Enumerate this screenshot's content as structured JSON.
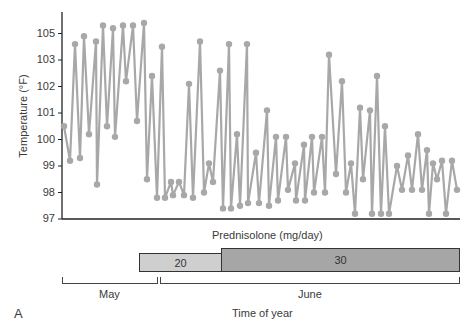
{
  "panel_label": "A",
  "y_axis": {
    "title": "Temperature (°F)",
    "tick_labels": [
      "105",
      "103",
      "102",
      "101",
      "100",
      "99",
      "98",
      "97"
    ]
  },
  "drug": {
    "title": "Prednisolone (mg/day)",
    "doses": [
      {
        "label": "20",
        "color": "#cfcfcf"
      },
      {
        "label": "30",
        "color": "#a6a6a6"
      }
    ]
  },
  "time_axis": {
    "title": "Time of year",
    "months": [
      "May",
      "June"
    ]
  },
  "chart_data": {
    "type": "line",
    "title": "",
    "xlabel": "Time of year",
    "ylabel": "Temperature (°F)",
    "ylim": [
      97,
      105.5
    ],
    "y_tick_labels": [
      "97",
      "98",
      "99",
      "100",
      "101",
      "102",
      "103",
      "105"
    ],
    "grid": false,
    "line_color": "#a8a8a8",
    "x_note": "x = relative horizontal position along time axis (0 = axis start, 397 = axis end); May spans ~0-95, June ~98-397",
    "x": [
      2,
      8,
      13,
      18,
      22,
      27,
      34,
      35,
      41,
      45,
      51,
      53,
      61,
      64,
      71,
      75,
      82,
      85,
      90,
      95,
      100,
      103,
      109,
      111,
      117,
      122,
      127,
      131,
      138,
      142,
      147,
      151,
      158,
      161,
      167,
      169,
      175,
      178,
      185,
      186,
      194,
      197,
      205,
      207,
      214,
      216,
      224,
      226,
      233,
      234,
      242,
      243,
      250,
      252,
      260,
      263,
      267,
      274,
      280,
      284,
      289,
      293,
      298,
      301,
      308,
      310,
      315,
      319,
      323,
      327,
      335,
      340,
      346,
      350,
      356,
      360,
      365,
      367,
      371,
      375,
      380,
      384,
      390,
      395
    ],
    "values": [
      100.5,
      99.2,
      103.6,
      99.3,
      103.9,
      100.2,
      103.7,
      98.3,
      104.3,
      100.5,
      104.2,
      100.1,
      104.3,
      102.2,
      104.3,
      100.7,
      104.4,
      98.5,
      102.4,
      97.8,
      103.5,
      97.8,
      98.4,
      97.9,
      98.4,
      97.9,
      102.1,
      97.8,
      103.7,
      98.0,
      99.1,
      98.4,
      102.6,
      97.4,
      103.6,
      97.4,
      100.2,
      97.5,
      103.6,
      97.6,
      99.5,
      97.6,
      101.1,
      97.5,
      100.1,
      97.7,
      100.1,
      98.1,
      99.1,
      97.7,
      99.8,
      97.7,
      100.1,
      98.0,
      100.1,
      98.0,
      103.2,
      98.7,
      102.2,
      98.0,
      99.1,
      97.2,
      101.2,
      98.5,
      101.1,
      97.2,
      102.4,
      97.2,
      100.5,
      97.2,
      99.0,
      98.1,
      99.4,
      98.1,
      100.2,
      98.1,
      99.6,
      97.2,
      99.1,
      98.5,
      99.2,
      97.2,
      99.2,
      98.1
    ],
    "annotations": [
      {
        "type": "dose_bar",
        "label": "Prednisolone 20 mg/day",
        "x_range": [
          77,
          159
        ]
      },
      {
        "type": "dose_bar",
        "label": "Prednisolone 30 mg/day",
        "x_range": [
          159,
          397
        ]
      },
      {
        "type": "period",
        "label": "May",
        "x_range": [
          0,
          95
        ]
      },
      {
        "type": "period",
        "label": "June",
        "x_range": [
          98,
          397
        ]
      }
    ]
  }
}
